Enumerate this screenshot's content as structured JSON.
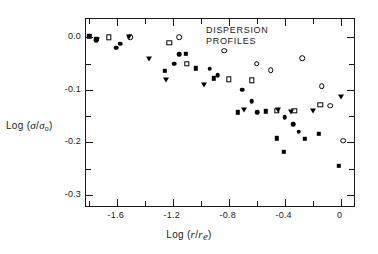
{
  "figure": {
    "annotation": "DISPERSION\nPROFILES",
    "background_color": "#ffffff",
    "frame_color": "#1a1a1a"
  },
  "chart_data": {
    "type": "scatter",
    "title": "DISPERSION PROFILES",
    "xlabel": "Log (r/r_e)",
    "ylabel": "Log (sigma/sigma_0)",
    "xlim": [
      -1.82,
      0.11
    ],
    "ylim": [
      -0.325,
      0.035
    ],
    "grid": false,
    "legend": "none",
    "xticks_major": [
      -1.6,
      -1.2,
      -0.8,
      -0.4,
      0
    ],
    "xticks_major_labels": [
      "-1.6",
      "-1.2",
      "-0.8",
      "-0.4",
      "0"
    ],
    "xticks_minor": [
      -1.8,
      -1.4,
      -1.0,
      -0.6,
      -0.2
    ],
    "yticks_major": [
      0.0,
      -0.1,
      -0.2,
      -0.3
    ],
    "yticks_major_labels": [
      "0.0",
      "-0.1",
      "-0.2",
      "-0.3"
    ],
    "yticks_minor": [
      -0.05,
      -0.15,
      -0.25
    ],
    "marker_colors": {
      "filled": "#000000",
      "open_fill": "#ffffff",
      "open_edge": "#000000"
    },
    "series": [
      {
        "name": "filled-square",
        "marker": "filled-square",
        "points": [
          [
            -1.795,
            0.002
          ],
          [
            -1.745,
            -0.003
          ],
          [
            -1.255,
            -0.064
          ],
          [
            -1.105,
            -0.031
          ],
          [
            -1.035,
            -0.059
          ],
          [
            -0.905,
            -0.078
          ],
          [
            -0.735,
            -0.143
          ],
          [
            -0.535,
            -0.141
          ],
          [
            -0.455,
            -0.192
          ],
          [
            -0.405,
            -0.218
          ],
          [
            -0.255,
            -0.193
          ],
          [
            -0.155,
            -0.184
          ],
          [
            -0.015,
            -0.245
          ]
        ]
      },
      {
        "name": "open-square",
        "marker": "open-square",
        "points": [
          [
            -1.655,
            0.0
          ],
          [
            -1.225,
            -0.01
          ],
          [
            -1.1,
            -0.05
          ],
          [
            -0.8,
            -0.08
          ],
          [
            -0.635,
            -0.082
          ],
          [
            -0.455,
            -0.14
          ],
          [
            -0.33,
            -0.14
          ],
          [
            -0.145,
            -0.128
          ]
        ]
      },
      {
        "name": "filled-circle",
        "marker": "filled-circle",
        "points": [
          [
            -1.745,
            -0.005
          ],
          [
            -1.605,
            -0.02
          ],
          [
            -1.575,
            -0.012
          ],
          [
            -1.19,
            -0.05
          ],
          [
            -1.155,
            -0.032
          ],
          [
            -0.935,
            -0.06
          ],
          [
            -0.88,
            -0.072
          ],
          [
            -0.705,
            -0.1
          ],
          [
            -0.635,
            -0.122
          ],
          [
            -0.595,
            -0.143
          ],
          [
            -0.4,
            -0.152
          ],
          [
            -0.34,
            -0.165
          ],
          [
            -0.3,
            -0.18
          ]
        ]
      },
      {
        "name": "open-circle",
        "marker": "open-circle",
        "points": [
          [
            -1.505,
            0.0
          ],
          [
            -1.155,
            0.0
          ],
          [
            -0.83,
            -0.025
          ],
          [
            -0.6,
            -0.05
          ],
          [
            -0.5,
            -0.062
          ],
          [
            -0.275,
            -0.04
          ],
          [
            -0.135,
            -0.093
          ],
          [
            -0.075,
            -0.13
          ],
          [
            0.02,
            -0.197
          ]
        ]
      },
      {
        "name": "filled-triangle-down",
        "marker": "filled-triangle-down",
        "points": [
          [
            -1.74,
            -0.005
          ],
          [
            -1.51,
            0.0
          ],
          [
            -1.37,
            -0.042
          ],
          [
            -1.25,
            -0.082
          ],
          [
            -0.975,
            -0.09
          ],
          [
            -0.69,
            -0.138
          ],
          [
            -0.45,
            -0.138
          ],
          [
            -0.355,
            -0.143
          ],
          [
            -0.195,
            -0.14
          ],
          [
            0.005,
            -0.113
          ]
        ]
      }
    ]
  }
}
